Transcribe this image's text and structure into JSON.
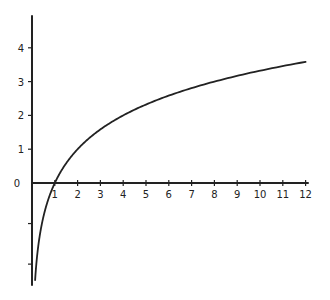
{
  "chart_data": {
    "type": "line",
    "title": "",
    "xlabel": "",
    "ylabel": "",
    "function": "y = log2(x)",
    "xlim": [
      0,
      12
    ],
    "ylim": [
      -3,
      4.5
    ],
    "grid": false,
    "legend": null,
    "x_ticks": [
      "1",
      "2",
      "3",
      "4",
      "5",
      "6",
      "7",
      "8",
      "9",
      "10",
      "11",
      "12"
    ],
    "y_ticks": [
      "4",
      "3",
      "2",
      "1",
      "0"
    ],
    "unlabeled_y_ticks": [
      -1.2,
      -2.4
    ],
    "series": [
      {
        "name": "curve",
        "x": [
          0.1,
          0.25,
          0.5,
          1,
          2,
          3,
          4,
          5,
          6,
          7,
          8,
          9,
          10,
          11,
          12
        ],
        "values": [
          -3.0,
          -2.0,
          -1.0,
          0,
          1.0,
          1.58,
          2.0,
          2.32,
          2.58,
          2.81,
          3.0,
          3.17,
          3.32,
          3.46,
          3.58
        ]
      }
    ]
  }
}
